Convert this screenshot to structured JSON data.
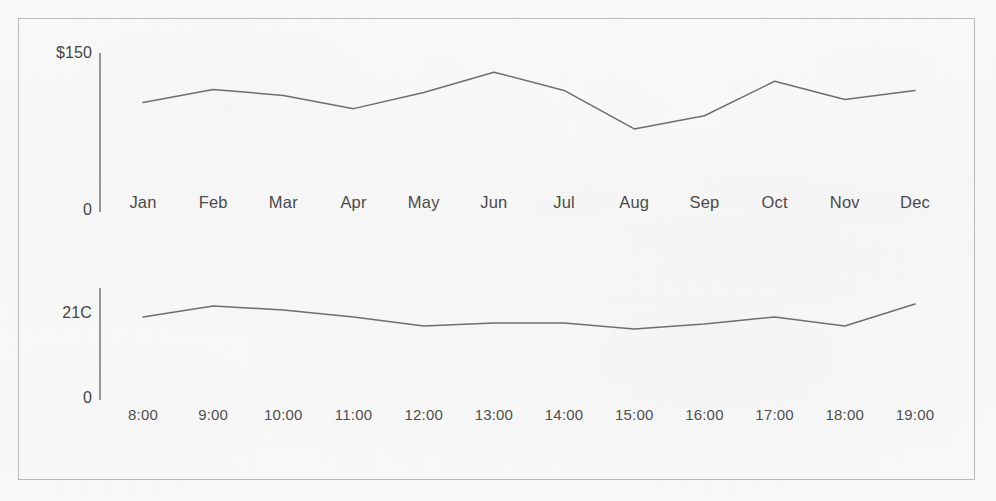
{
  "figure": {
    "background_color": "#fbfbfb",
    "frame_color": "#b9b9b9",
    "line_color": "#6e6e6e",
    "text_color": "#4a4a4a",
    "axis_color": "#8c8c8c"
  },
  "chart_data": [
    {
      "type": "line",
      "id": "monthly-price",
      "title": "",
      "xlabel": "",
      "ylabel": "",
      "ylim": [
        0,
        150
      ],
      "y_tick_labels": [
        "$150",
        "0"
      ],
      "y_tick_values": [
        150,
        0
      ],
      "grid": false,
      "legend": "none",
      "categories": [
        "Jan",
        "Feb",
        "Mar",
        "Apr",
        "May",
        "Jun",
        "Jul",
        "Aug",
        "Sep",
        "Oct",
        "Nov",
        "Dec"
      ],
      "values": [
        108,
        121,
        115,
        102,
        118,
        138,
        120,
        82,
        95,
        129,
        111,
        120
      ],
      "series": [
        {
          "name": "Price",
          "values": [
            108,
            121,
            115,
            102,
            118,
            138,
            120,
            82,
            95,
            129,
            111,
            120
          ]
        }
      ]
    },
    {
      "type": "line",
      "id": "hourly-temperature",
      "title": "",
      "xlabel": "",
      "ylabel": "",
      "ylim": [
        0,
        21
      ],
      "y_tick_labels": [
        "21C",
        "0"
      ],
      "y_tick_values": [
        21,
        0
      ],
      "grid": false,
      "legend": "none",
      "categories": [
        "8:00",
        "9:00",
        "10:00",
        "11:00",
        "12:00",
        "13:00",
        "14:00",
        "15:00",
        "16:00",
        "17:00",
        "18:00",
        "19:00"
      ],
      "values": [
        16.6,
        18.8,
        18.0,
        16.6,
        14.8,
        15.4,
        15.4,
        14.2,
        15.2,
        16.6,
        14.8,
        19.2
      ],
      "series": [
        {
          "name": "Temperature",
          "values": [
            16.6,
            18.8,
            18.0,
            16.6,
            14.8,
            15.4,
            15.4,
            14.2,
            15.2,
            16.6,
            14.8,
            19.2
          ]
        }
      ]
    }
  ],
  "price_chart": {
    "y_axis": {
      "top_label": "$150",
      "bottom_label": "0"
    },
    "x_tick_labels": [
      "Jan",
      "Feb",
      "Mar",
      "Apr",
      "May",
      "Jun",
      "Jul",
      "Aug",
      "Sep",
      "Oct",
      "Nov",
      "Dec"
    ]
  },
  "temperature_chart": {
    "y_axis": {
      "top_label": "21C",
      "bottom_label": "0"
    },
    "x_tick_labels": [
      "8:00",
      "9:00",
      "10:00",
      "11:00",
      "12:00",
      "13:00",
      "14:00",
      "15:00",
      "16:00",
      "17:00",
      "18:00",
      "19:00"
    ]
  }
}
